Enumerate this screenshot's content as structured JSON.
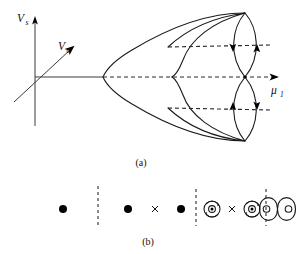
{
  "figure": {
    "panels": [
      {
        "id": "a",
        "caption": "(a)",
        "axes": {
          "vertical_label": "V",
          "vertical_sub": "s",
          "oblique_label": "V",
          "oblique_sub": "a",
          "horizontal_label": "μ",
          "horizontal_sub": "1"
        },
        "elements": {
          "outer_parabola": "outer leftward-opening curve",
          "inner_parabola": "inner leftward-opening curve",
          "upper_loop": "upper lens-shaped closed orbit",
          "lower_loop": "lower lens-shaped closed orbit",
          "axis_dashed": "central dashed mu-1 axis",
          "upper_dashed": "upper dashed branch line",
          "lower_dashed": "lower dashed branch line"
        },
        "arrows": [
          {
            "name": "upper-left-branch-arrow",
            "direction": "down"
          },
          {
            "name": "upper-right-branch-arrow",
            "direction": "up"
          },
          {
            "name": "lower-left-branch-arrow",
            "direction": "up"
          },
          {
            "name": "lower-right-branch-arrow",
            "direction": "down"
          }
        ]
      },
      {
        "id": "b",
        "caption": "(b)",
        "symbols": [
          {
            "name": "filled-dot",
            "type": "dot",
            "x": 63
          },
          {
            "name": "divider-dashed-line",
            "type": "divider",
            "x": 98
          },
          {
            "name": "filled-dot",
            "type": "dot",
            "x": 128
          },
          {
            "name": "cross-mark",
            "type": "cross",
            "x": 155
          },
          {
            "name": "filled-dot",
            "type": "dot",
            "x": 181
          },
          {
            "name": "divider-dashed-line",
            "type": "divider",
            "x": 196
          },
          {
            "name": "circled-dot-orbit",
            "type": "orbit-dot",
            "x": 212
          },
          {
            "name": "cross-mark",
            "type": "cross",
            "x": 232
          },
          {
            "name": "circled-dot-orbit",
            "type": "orbit-dot",
            "x": 252
          },
          {
            "name": "divider-dashed-line",
            "type": "divider",
            "x": 266
          },
          {
            "name": "double-loop",
            "type": "double-loop",
            "x": 278
          }
        ]
      }
    ]
  }
}
